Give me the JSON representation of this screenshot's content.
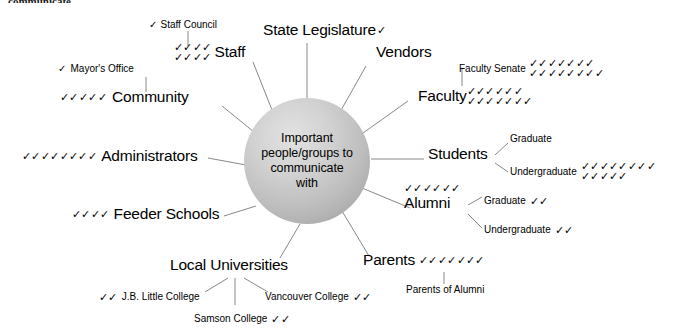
{
  "page": {
    "top_text_fragment": "communicate.",
    "check_glyph": "✓"
  },
  "center": {
    "label": "Important people/groups to communicate with",
    "line1": "Important",
    "line2": "people/groups to",
    "line3": "communicate",
    "line4": "with"
  },
  "branches": [
    {
      "id": "staff",
      "label": "Staff",
      "checks_rows": [
        4,
        4
      ],
      "checks_total": 8,
      "checks_position": "before",
      "children": [
        {
          "label": "Staff Council",
          "checks": 1,
          "checks_position": "before"
        }
      ]
    },
    {
      "id": "state-legislature",
      "label": "State Legislature",
      "checks_rows": [
        1
      ],
      "checks_total": 1,
      "checks_position": "after",
      "children": []
    },
    {
      "id": "vendors",
      "label": "Vendors",
      "checks_rows": [],
      "checks_total": 0,
      "checks_position": "after",
      "children": []
    },
    {
      "id": "faculty",
      "label": "Faculty",
      "checks_rows": [
        6,
        7
      ],
      "checks_total": 13,
      "checks_position": "after",
      "children": [
        {
          "label": "Faculty Senate",
          "checks_rows": [
            7,
            8
          ],
          "checks": 15,
          "checks_position": "after"
        }
      ]
    },
    {
      "id": "students",
      "label": "Students",
      "checks_rows": [],
      "checks_total": 0,
      "checks_position": "after",
      "children": [
        {
          "label": "Graduate",
          "checks": 0,
          "checks_position": "after"
        },
        {
          "label": "Undergraduate",
          "checks_rows": [
            8,
            5
          ],
          "checks": 13,
          "checks_position": "after"
        }
      ]
    },
    {
      "id": "alumni",
      "label": "Alumni",
      "checks_rows": [
        6
      ],
      "checks_total": 6,
      "checks_position": "above",
      "children": [
        {
          "label": "Graduate",
          "checks": 2,
          "checks_position": "after"
        },
        {
          "label": "Undergraduate",
          "checks": 2,
          "checks_position": "after"
        }
      ]
    },
    {
      "id": "parents",
      "label": "Parents",
      "checks_rows": [
        7
      ],
      "checks_total": 7,
      "checks_position": "after",
      "children": [
        {
          "label": "Parents of Alumni",
          "checks": 0,
          "checks_position": "after"
        }
      ]
    },
    {
      "id": "local-universities",
      "label": "Local Universities",
      "checks_rows": [],
      "checks_total": 0,
      "checks_position": "after",
      "children": [
        {
          "label": "J.B. Little College",
          "checks": 2,
          "checks_position": "before"
        },
        {
          "label": "Samson College",
          "checks": 2,
          "checks_position": "after"
        },
        {
          "label": "Vancouver College",
          "checks": 2,
          "checks_position": "after"
        }
      ]
    },
    {
      "id": "feeder-schools",
      "label": "Feeder Schools",
      "checks_rows": [
        4
      ],
      "checks_total": 4,
      "checks_position": "before",
      "children": []
    },
    {
      "id": "administrators",
      "label": "Administrators",
      "checks_rows": [
        8
      ],
      "checks_total": 8,
      "checks_position": "before",
      "children": []
    },
    {
      "id": "community",
      "label": "Community",
      "checks_rows": [
        5
      ],
      "checks_total": 5,
      "checks_position": "before",
      "children": [
        {
          "label": "Mayor's Office",
          "checks": 1,
          "checks_position": "before"
        }
      ]
    }
  ],
  "colors": {
    "line": "#888888",
    "text": "#000000",
    "sphere_light": "#e2e2e2",
    "sphere_dark": "#9a9a9a",
    "background": "#ffffff"
  }
}
